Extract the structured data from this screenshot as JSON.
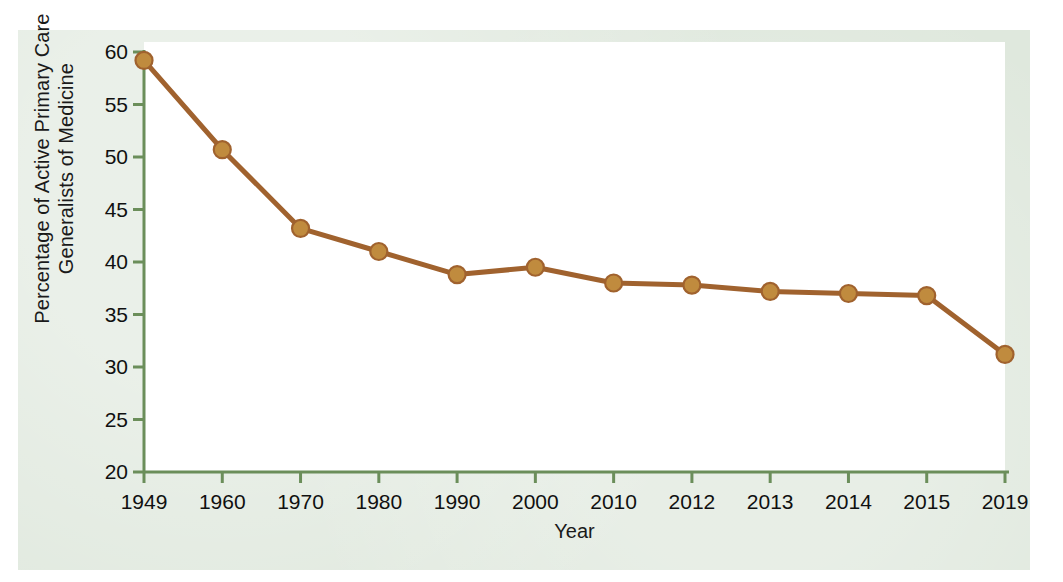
{
  "figure": {
    "background_color": "#dfe8dd",
    "plot_background_color": "#ffffff",
    "page_color": "#ffffff",
    "axis_color": "#6b8e5a",
    "series_color": "#a0622e",
    "marker_color": "#c08b3e"
  },
  "chart_data": {
    "type": "line",
    "title": "",
    "xlabel": "Year",
    "ylabel": "Percentage of Active Primary Care Generalists of Medicine",
    "ylabel_line1": "Percentage of Active Primary Care",
    "ylabel_line2": "Generalists of Medicine",
    "categories": [
      "1949",
      "1960",
      "1970",
      "1980",
      "1990",
      "2000",
      "2010",
      "2012",
      "2013",
      "2014",
      "2015",
      "2019"
    ],
    "x": [
      1949,
      1960,
      1970,
      1980,
      1990,
      2000,
      2010,
      2012,
      2013,
      2014,
      2015,
      2019
    ],
    "values": [
      59.2,
      50.7,
      43.2,
      41.0,
      38.8,
      39.5,
      38.0,
      37.8,
      37.2,
      37.0,
      36.8,
      31.2
    ],
    "series": [
      {
        "name": "Percentage of Active Primary Care Generalists of Medicine",
        "values": [
          59.2,
          50.7,
          43.2,
          41.0,
          38.8,
          39.5,
          38.0,
          37.8,
          37.2,
          37.0,
          36.8,
          31.2
        ]
      }
    ],
    "ylim": [
      20,
      60
    ],
    "yticks": [
      20,
      25,
      30,
      35,
      40,
      45,
      50,
      55,
      60
    ],
    "ytick_labels": [
      "20",
      "25",
      "30",
      "35",
      "40",
      "45",
      "50",
      "55",
      "60"
    ],
    "xtick_labels": [
      "1949",
      "1960",
      "1970",
      "1980",
      "1990",
      "2000",
      "2010",
      "2012",
      "2013",
      "2014",
      "2015",
      "2019"
    ],
    "grid": false,
    "legend": null,
    "legend_position": "none",
    "markers": "circle",
    "annotations": []
  }
}
